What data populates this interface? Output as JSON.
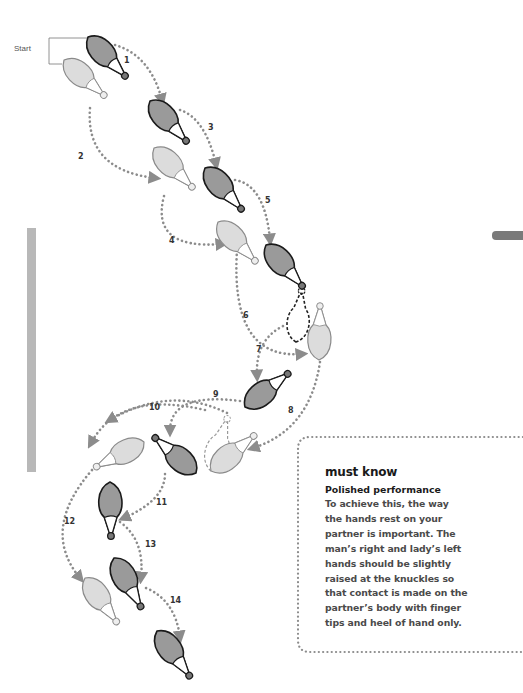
{
  "diagram": {
    "start_label": "Start",
    "colors": {
      "man_fill": "#9a9a9a",
      "man_stroke": "#1a1a1a",
      "lady_fill": "#dcdcdc",
      "lady_stroke": "#8a8a8a",
      "path_dots": "#8c8c8c",
      "side_bar": "#b8b8b8",
      "tab_mark": "#7a7a7a"
    },
    "steps": [
      {
        "n": "1",
        "x": 124,
        "y": 63
      },
      {
        "n": "2",
        "x": 78,
        "y": 159
      },
      {
        "n": "3",
        "x": 208,
        "y": 130
      },
      {
        "n": "4",
        "x": 169,
        "y": 243
      },
      {
        "n": "5",
        "x": 265,
        "y": 203
      },
      {
        "n": "6",
        "x": 243,
        "y": 318
      },
      {
        "n": "7",
        "x": 256,
        "y": 352
      },
      {
        "n": "8",
        "x": 288,
        "y": 413
      },
      {
        "n": "9",
        "x": 213,
        "y": 397
      },
      {
        "n": "10",
        "x": 149,
        "y": 410
      },
      {
        "n": "11",
        "x": 156,
        "y": 505
      },
      {
        "n": "12",
        "x": 64,
        "y": 524
      },
      {
        "n": "13",
        "x": 145,
        "y": 547
      },
      {
        "n": "14",
        "x": 170,
        "y": 603
      }
    ],
    "feet": [
      {
        "id": "man-start",
        "role": "man",
        "tx": 88,
        "ty": 37,
        "hx": 127,
        "hy": 78
      },
      {
        "id": "lady-start",
        "role": "lady",
        "tx": 64,
        "ty": 60,
        "hx": 106,
        "hy": 97
      },
      {
        "id": "man-1",
        "role": "man",
        "tx": 150,
        "ty": 101,
        "hx": 188,
        "hy": 143
      },
      {
        "id": "lady-2",
        "role": "lady",
        "tx": 154,
        "ty": 148,
        "hx": 194,
        "hy": 189
      },
      {
        "id": "man-3",
        "role": "man",
        "tx": 205,
        "ty": 168,
        "hx": 243,
        "hy": 211
      },
      {
        "id": "lady-4",
        "role": "lady",
        "tx": 218,
        "ty": 222,
        "hx": 257,
        "hy": 263
      },
      {
        "id": "man-5",
        "role": "man",
        "tx": 266,
        "ty": 245,
        "hx": 304,
        "hy": 288
      },
      {
        "id": "lady-6",
        "role": "lady",
        "tx": 319,
        "ty": 360,
        "hx": 320,
        "hy": 303
      },
      {
        "id": "man-7",
        "role": "man",
        "tx": 245,
        "ty": 407,
        "hx": 290,
        "hy": 372
      },
      {
        "id": "lady-8",
        "role": "lady",
        "tx": 211,
        "ty": 471,
        "hx": 256,
        "hy": 434
      },
      {
        "id": "man-9",
        "role": "man",
        "tx": 196,
        "ty": 473,
        "hx": 153,
        "hy": 436
      },
      {
        "id": "lady-10",
        "role": "lady",
        "tx": 144,
        "ty": 442,
        "hx": 94,
        "hy": 468
      },
      {
        "id": "man-11",
        "role": "man",
        "tx": 110,
        "ty": 482,
        "hx": 111,
        "hy": 539
      },
      {
        "id": "lady-12",
        "role": "lady",
        "tx": 85,
        "ty": 578,
        "hx": 118,
        "hy": 624
      },
      {
        "id": "man-13",
        "role": "man",
        "tx": 114,
        "ty": 558,
        "hx": 142,
        "hy": 609
      },
      {
        "id": "man-14",
        "role": "man",
        "tx": 157,
        "ty": 631,
        "hx": 191,
        "hy": 678
      }
    ],
    "ghost_feet": [
      {
        "id": "man-pivot-ghost",
        "role": "man",
        "tx": 296,
        "ty": 342,
        "hx": 302,
        "hy": 288
      },
      {
        "id": "lady-pivot-ghost",
        "role": "lady",
        "tx": 211,
        "ty": 471,
        "hx": 228,
        "hy": 416
      }
    ],
    "paths": [
      {
        "id": "path-1",
        "d": "M115,45 Q150,55 162,100"
      },
      {
        "id": "path-2",
        "d": "M90,108 Q85,170 155,178"
      },
      {
        "id": "path-3",
        "d": "M180,110 Q205,118 216,164"
      },
      {
        "id": "path-4",
        "d": "M164,196 Q150,250 222,244"
      },
      {
        "id": "path-5",
        "d": "M235,180 Q265,185 270,240"
      },
      {
        "id": "path-6",
        "d": "M237,250 Q230,360 302,354"
      },
      {
        "id": "path-7",
        "d": "M283,326 Q255,340 257,376"
      },
      {
        "id": "path-8",
        "d": "M320,362 Q310,430 253,448"
      },
      {
        "id": "path-9",
        "d": "M240,401 Q170,392 170,431"
      },
      {
        "id": "path-9b",
        "d": "M227,413 Q170,385 110,420"
      },
      {
        "id": "path-10",
        "d": "M205,410 Q120,390 91,443"
      },
      {
        "id": "path-11",
        "d": "M165,474 Q165,500 124,518"
      },
      {
        "id": "path-12",
        "d": "M92,470 Q40,530 80,578"
      },
      {
        "id": "path-13",
        "d": "M120,522 Q145,540 141,578"
      },
      {
        "id": "path-14",
        "d": "M146,588 Q175,600 180,637"
      }
    ]
  },
  "side": {
    "bar": "vertical-gray-rule",
    "tab": "section-tab-marker"
  },
  "info_box": {
    "title": "must know",
    "subtitle": "Polished performance",
    "body_lines": [
      "To achieve this, the way",
      "the hands rest on your",
      "partner is important. The",
      "man’s right and lady’s left",
      "hands should be slightly",
      "raised at the knuckles so",
      "that contact is made on the",
      "partner’s body with finger",
      "tips and heel of hand only."
    ]
  }
}
